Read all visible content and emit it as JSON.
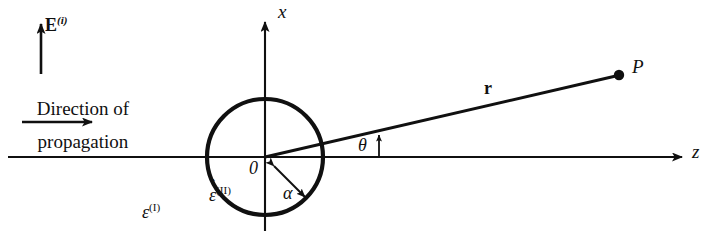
{
  "figure": {
    "name": "scattering-geometry-diagram",
    "background_color": "#ffffff",
    "ink_color": "#101010"
  },
  "labels": {
    "incident_field": {
      "symbol": "E",
      "superscript": "(i)"
    },
    "direction_line1": "Direction of",
    "direction_line2": "propagation",
    "x_axis": "x",
    "z_axis": "z",
    "origin": "0",
    "radius": "α",
    "angle": "θ",
    "position_vector": "r",
    "field_point": "P",
    "permittivity_inside": {
      "symbol": "ε",
      "hat": "ˆ",
      "superscript": "(II)"
    },
    "permittivity_outside": {
      "symbol": "ε",
      "superscript": "(I)"
    }
  },
  "geometry": {
    "sphere_center": {
      "x": 265,
      "y": 157
    },
    "sphere_radius": 58,
    "z_axis": {
      "x1": 8,
      "y1": 157,
      "x2": 688,
      "y2": 157
    },
    "x_axis": {
      "x1": 265,
      "y1": 228,
      "x2": 265,
      "y2": 16
    },
    "r_vector": {
      "x1": 265,
      "y1": 157,
      "x2": 619,
      "y2": 75
    },
    "field_point_dot": {
      "x": 619,
      "y": 75,
      "r": 5
    },
    "radius_arrow": {
      "x1": 272,
      "y1": 164,
      "x2": 308,
      "y2": 200
    },
    "propagation_arrow": {
      "x1": 22,
      "y1": 122,
      "x2": 96,
      "y2": 122
    },
    "e_field_arrow": {
      "x1": 41,
      "y1": 73,
      "x2": 41,
      "y2": 22
    },
    "theta_tick": {
      "x": 379,
      "y_bottom": 157,
      "y_top": 133
    }
  }
}
